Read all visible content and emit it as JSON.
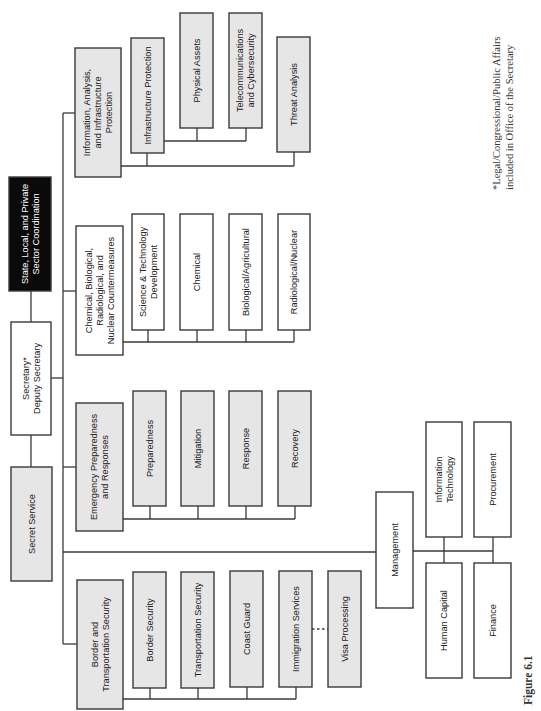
{
  "figure_label": "Figure 6.1",
  "footnote": [
    "*Legal/Congressional/Public Affairs",
    "included in Office of the Secretary"
  ],
  "colors": {
    "gray_fill": "#e6e6e6",
    "white_fill": "#ffffff",
    "black_fill": "#0a0a0a",
    "line": "#3a3a3a"
  },
  "root": {
    "id": "secretary",
    "label": [
      "Secretary*",
      "Deputy Secretary"
    ],
    "style": "white"
  },
  "attached_units": [
    {
      "id": "state-local-private",
      "label": [
        "State, Local, and Private",
        "Sector Coordination"
      ],
      "style": "black"
    },
    {
      "id": "secret-service",
      "label": [
        "Secret Service"
      ],
      "style": "gray"
    }
  ],
  "directorates": [
    {
      "id": "iaip",
      "label": [
        "Information, Analysis,",
        "and Infrastructure",
        "Protection"
      ],
      "style": "gray",
      "children": [
        {
          "id": "infrastructure-protection",
          "label": [
            "Infrastructure Protection"
          ],
          "style": "gray",
          "children": [
            {
              "id": "physical-assets",
              "label": [
                "Physical Assets"
              ],
              "style": "gray"
            },
            {
              "id": "telecom-cyber",
              "label": [
                "Telecommunications",
                "and Cybersecurity"
              ],
              "style": "gray"
            }
          ]
        },
        {
          "id": "threat-analysis",
          "label": [
            "Threat Analysis"
          ],
          "style": "gray"
        }
      ]
    },
    {
      "id": "cbrn",
      "label": [
        "Chemical, Biological,",
        "Radiological, and",
        "Nuclear Countermeasures"
      ],
      "style": "white",
      "children": [
        {
          "id": "sci-tech-dev",
          "label": [
            "Science & Technology",
            "Development"
          ],
          "style": "white"
        },
        {
          "id": "chemical",
          "label": [
            "Chemical"
          ],
          "style": "white"
        },
        {
          "id": "bio-ag",
          "label": [
            "Biological/Agricultural"
          ],
          "style": "white"
        },
        {
          "id": "rad-nuclear",
          "label": [
            "Radiological/Nuclear"
          ],
          "style": "white"
        }
      ]
    },
    {
      "id": "epr",
      "label": [
        "Emergency Preparedness",
        "and Responses"
      ],
      "style": "gray",
      "children": [
        {
          "id": "preparedness",
          "label": [
            "Preparedness"
          ],
          "style": "gray"
        },
        {
          "id": "mitigation",
          "label": [
            "Mitigation"
          ],
          "style": "gray"
        },
        {
          "id": "response",
          "label": [
            "Response"
          ],
          "style": "gray"
        },
        {
          "id": "recovery",
          "label": [
            "Recovery"
          ],
          "style": "gray"
        }
      ]
    },
    {
      "id": "management",
      "label": [
        "Management"
      ],
      "style": "white",
      "children": [
        {
          "id": "info-tech",
          "label": [
            "Information",
            "Technology"
          ],
          "style": "white"
        },
        {
          "id": "procurement",
          "label": [
            "Procurement"
          ],
          "style": "white"
        },
        {
          "id": "human-capital",
          "label": [
            "Human Capital"
          ],
          "style": "white"
        },
        {
          "id": "finance",
          "label": [
            "Finance"
          ],
          "style": "white"
        }
      ]
    },
    {
      "id": "bts",
      "label": [
        "Border and",
        "Transportation Security"
      ],
      "style": "gray",
      "children": [
        {
          "id": "border-security",
          "label": [
            "Border Security"
          ],
          "style": "gray"
        },
        {
          "id": "transportation-security",
          "label": [
            "Transportation Security"
          ],
          "style": "gray"
        },
        {
          "id": "coast-guard",
          "label": [
            "Coast Guard"
          ],
          "style": "gray"
        },
        {
          "id": "immigration-services",
          "label": [
            "Immigration Services"
          ],
          "style": "gray"
        },
        {
          "id": "visa-processing",
          "label": [
            "Visa Processing"
          ],
          "style": "gray",
          "link": "dotted"
        }
      ]
    }
  ]
}
